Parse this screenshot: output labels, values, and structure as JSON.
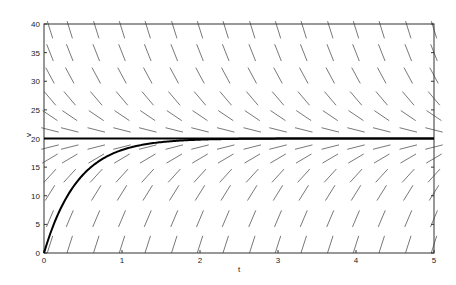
{
  "chart_data": {
    "type": "line",
    "title": "",
    "subtitle": "Direction field with equilibrium and solution curve",
    "xlabel": "t",
    "ylabel": "v",
    "xlim": [
      0,
      5
    ],
    "ylim": [
      0,
      40
    ],
    "xticks": [
      "0",
      "1",
      "2",
      "3",
      "4",
      "5"
    ],
    "yticks": [
      "0",
      "5",
      "10",
      "15",
      "20",
      "25",
      "30",
      "35",
      "40"
    ],
    "grid": false,
    "legend": null,
    "direction_field": {
      "equation": "dv/dt = k*(20 - v)",
      "k": 2.3,
      "t_samples": [
        0.0,
        0.33,
        0.67,
        1.0,
        1.33,
        1.67,
        2.0,
        2.33,
        2.67,
        3.0,
        3.33,
        3.67,
        4.0,
        4.33,
        4.67,
        5.0
      ],
      "v_samples": [
        1.5,
        6,
        10.5,
        13.5,
        16.5,
        18.5,
        21.5,
        24,
        27,
        31,
        35,
        39
      ]
    },
    "series": [
      {
        "name": "equilibrium",
        "style": "thick",
        "x": [
          0,
          5
        ],
        "values": [
          20,
          20
        ]
      },
      {
        "name": "solution v(0)=0",
        "style": "thick",
        "x": [
          0,
          0.25,
          0.5,
          0.75,
          1.0,
          1.5,
          2.0,
          2.5,
          3.0,
          4.0,
          5.0
        ],
        "values": [
          0,
          8.7,
          13.7,
          16.4,
          18.0,
          19.4,
          19.8,
          19.9,
          20.0,
          20.0,
          20.0
        ]
      }
    ]
  }
}
